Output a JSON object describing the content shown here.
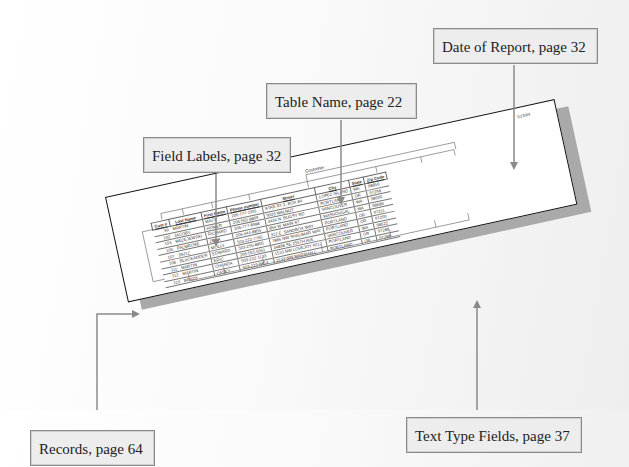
{
  "callouts": {
    "date_of_report": "Date of Report, page 32",
    "table_name": "Table Name, page 22",
    "field_labels": "Field Labels, page 32",
    "records": "Records, page 64",
    "text_type_fields": "Text Type Fields, page 37"
  },
  "report": {
    "date": "1/23/94",
    "title": "Customer",
    "columns": [
      "Cust #",
      "Last Name",
      "First Name",
      "Phone number",
      "Street",
      "City",
      "State",
      "Zip Code"
    ],
    "rows": [
      {
        "cust": "99",
        "last": "MARTIN",
        "first": "MACK",
        "phone": "206-777-1991",
        "street": "STAR RT 2, BOX 84",
        "city": "LOPEZ ISLAND",
        "state": "WA",
        "zip": "98856"
      },
      {
        "cust": "102",
        "last": "JACOBY",
        "first": "HOMER",
        "phone": "206-555-8899",
        "street": "9923 WALNUT",
        "city": "PORTLAND",
        "state": "OR",
        "zip": "97298"
      },
      {
        "cust": "104",
        "last": "MEZEJEWSKI",
        "first": "RICHARD",
        "phone": "206-777-8988",
        "street": "3434 N. BUGSY RD",
        "city": "VANCOUVER",
        "state": "WA",
        "zip": "98600"
      },
      {
        "cust": "105",
        "last": "PALMROSE",
        "first": "ZENA",
        "phone": "206-444-8855",
        "street": "854 W. MAIN ST",
        "city": "WASHOUGAL",
        "state": "WA",
        "zip": "98686"
      },
      {
        "cust": "107",
        "last": "SKITZ",
        "first": "MOLLY",
        "phone": "503-222-7765",
        "street": "312 E. SANDBOX WAY",
        "city": "PORTLAND",
        "state": "OR",
        "zip": "97211"
      },
      {
        "cust": "108",
        "last": "BLACKADDER",
        "first": "EDWARD",
        "phone": "503-255-8855",
        "street": "7886 NW SHALIMAR WAY",
        "city": "PORTLAND",
        "state": "OR",
        "zip": "97200"
      },
      {
        "cust": "111",
        "last": "MARTIN",
        "first": "ERIC",
        "phone": "206-555-5551",
        "street": "34898 SE 255TH AVE",
        "city": "VANCOUVER",
        "state": "WA",
        "zip": "98622"
      },
      {
        "cust": "112",
        "last": "MARTIN",
        "first": "CHANDA",
        "phone": "503-222-1133",
        "street": "1510 NW LOVEJOY #212",
        "city": "PORTLAND",
        "state": "OR",
        "zip": "97288"
      },
      {
        "cust": "113",
        "last": "BRADY",
        "first": "CASEY",
        "phone": "503-223-8853",
        "street": "2133 NW MARSHALL",
        "city": "PORTLAND",
        "state": "OR",
        "zip": "97288"
      }
    ]
  },
  "colors": {
    "callout_fill": "#ededed",
    "callout_border": "#8a8a8a",
    "arrow": "#8a8a8a",
    "report_border": "#111111",
    "report_shadow": "#a9a9a9"
  }
}
